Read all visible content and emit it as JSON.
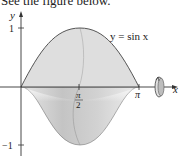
{
  "caption": "See the figure below.",
  "figure": {
    "curve_label": "y = sin x",
    "axes": {
      "x_label": "x",
      "y_label": "y"
    },
    "ticks": {
      "y_top": "1",
      "y_bottom": "−1",
      "x_mid_num": "π",
      "x_mid_den": "2",
      "x_end": "π"
    },
    "colors": {
      "upper_fill": "#dcdcdc",
      "lower_fill": "#c9c9c9",
      "curve": "#555555",
      "axis": "#333333"
    },
    "rotation_icon": "rotation-about-x-axis-icon"
  }
}
